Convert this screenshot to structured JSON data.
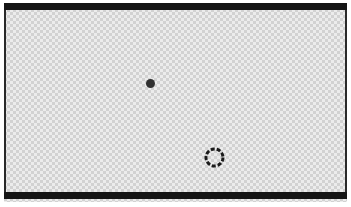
{
  "canvas": {
    "label": "transparent-canvas",
    "width_px": 343,
    "height_px": 199,
    "background_style": "checkerboard-transparency",
    "checker_cell_px": 3,
    "checker_light_color": "#ececec",
    "checker_dark_color": "#d2d2d2"
  },
  "frame": {
    "top_bar_label": "top-frame-bar",
    "bottom_bar_label": "bottom-frame-bar",
    "left_edge_label": "left-frame-edge",
    "right_edge_label": "right-frame-edge",
    "bar_color": "#151515",
    "edge_color": "#2a2a2a",
    "top_bar_height_px": 7,
    "bottom_bar_height_px": 7,
    "side_edge_width_px": 2
  },
  "objects": [
    {
      "name": "dot-marker",
      "icon": "filled-dot-icon",
      "shape": "circle-filled",
      "color": "#303030",
      "diameter_px": 9,
      "center_x_px": 150,
      "center_y_px": 83
    },
    {
      "name": "ring-indicator",
      "icon": "dashed-ring-icon",
      "shape": "circle-dashed-outline",
      "color": "#1a1a1a",
      "outer_diameter_px": 23,
      "stroke_width_px": 3,
      "dash_length_px": 4,
      "gap_length_px": 2,
      "center_x_px": 214,
      "center_y_px": 157
    }
  ],
  "ring_geometry": {
    "cx": 11.5,
    "cy": 11.5,
    "r": 8.5,
    "stroke": "#1a1a1a",
    "stroke_width": 3,
    "dasharray": "4 2"
  }
}
